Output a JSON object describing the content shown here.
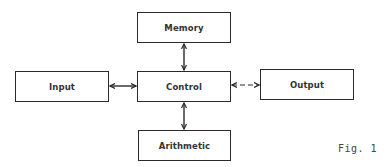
{
  "diagram": {
    "type": "block-diagram",
    "nodes": [
      {
        "id": "memory",
        "label": "Memory"
      },
      {
        "id": "input",
        "label": "Input"
      },
      {
        "id": "control",
        "label": "Control"
      },
      {
        "id": "output",
        "label": "Output"
      },
      {
        "id": "arithmetic",
        "label": "Arithmetic"
      }
    ],
    "edges": [
      {
        "from": "memory",
        "to": "control",
        "direction": "bidirectional"
      },
      {
        "from": "input",
        "to": "control",
        "direction": "bidirectional"
      },
      {
        "from": "control",
        "to": "output",
        "direction": "bidirectional"
      },
      {
        "from": "control",
        "to": "arithmetic",
        "direction": "bidirectional"
      }
    ],
    "caption": "Fig. 1"
  },
  "colors": {
    "line": "#2a2a2a",
    "text": "#333333",
    "background": "#ffffff"
  }
}
